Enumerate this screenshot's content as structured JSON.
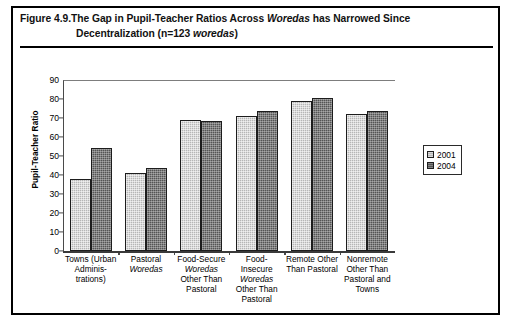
{
  "caption": {
    "figure_number": "Figure 4.9.",
    "line1_a": "The Gap in Pupil-Teacher Ratios Across ",
    "line1_italic": "Woredas",
    "line1_b": " has Narrowed Since",
    "line2_a": "Decentralization (n=123 ",
    "line2_italic": "woredas",
    "line2_b": ")"
  },
  "chart_data": {
    "type": "bar",
    "title": "The Gap in Pupil-Teacher Ratios Across Woredas has Narrowed Since Decentralization (n=123 woredas)",
    "xlabel": "",
    "ylabel": "Pupil-Teacher Ratio",
    "ylim": [
      0,
      90
    ],
    "ytick_step": 10,
    "yticks": [
      0,
      10,
      20,
      30,
      40,
      50,
      60,
      70,
      80,
      90
    ],
    "grid": false,
    "legend_position": "right",
    "categories": [
      "Towns (Urban Administrations)",
      "Pastoral Woredas",
      "Food-Secure Woredas Other Than Pastoral",
      "Food-Insecure Woredas Other Than Pastoral",
      "Remote Other Than Pastoral",
      "Nonremote Other Than Pastoral and Towns"
    ],
    "category_lines": [
      [
        "Towns (Urban",
        "Adminis-",
        "trations)"
      ],
      [
        "Pastoral",
        "Woredas"
      ],
      [
        "Food-Secure",
        "Woredas",
        "Other Than",
        "Pastoral"
      ],
      [
        "Food-",
        "Insecure",
        "Woredas",
        "Other Than",
        "Pastoral"
      ],
      [
        "Remote Other",
        "Than Pastoral"
      ],
      [
        "Nonremote",
        "Other Than",
        "Pastoral and",
        "Towns"
      ]
    ],
    "series": [
      {
        "name": "2001",
        "color": "#b6b6b6",
        "values": [
          38,
          41,
          69,
          71,
          79,
          72
        ]
      },
      {
        "name": "2004",
        "color": "#545454",
        "values": [
          54,
          43.5,
          68.5,
          73.5,
          80.5,
          73.5
        ]
      }
    ]
  },
  "legend": {
    "items": [
      {
        "label": "2001",
        "swatch": "light-gray-swatch"
      },
      {
        "label": "2004",
        "swatch": "dark-gray-swatch"
      }
    ]
  }
}
